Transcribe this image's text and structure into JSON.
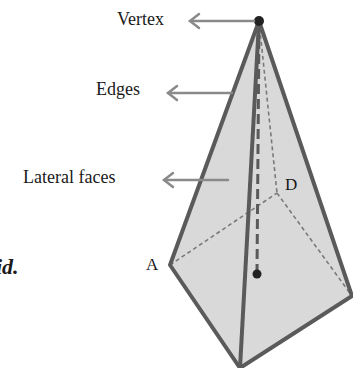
{
  "diagram": {
    "labels": {
      "vertex": "Vertex",
      "edges": "Edges",
      "lateral_faces": "Lateral faces",
      "point_a": "A",
      "point_d": "D",
      "cut_text": "id."
    },
    "colors": {
      "face_fill": "#d9d9d9",
      "edge_stroke": "#5a5a5a",
      "arrow": "#8a8a8a",
      "dashed": "#7a7a7a",
      "vertex_dot": "#222222"
    }
  }
}
